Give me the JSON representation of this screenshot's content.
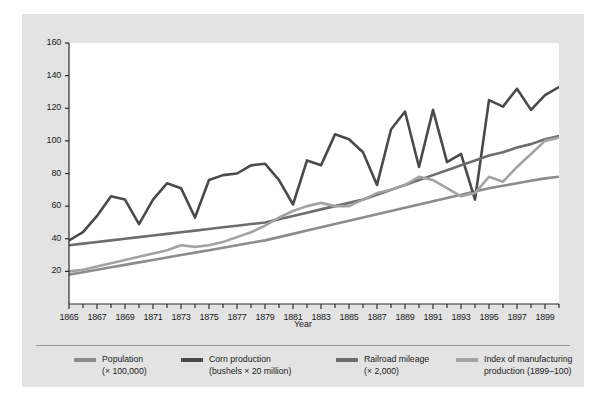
{
  "chart_data": {
    "type": "line",
    "title": "",
    "xlabel": "Year",
    "ylabel": "",
    "grid": false,
    "legend_position": "bottom",
    "xlim": [
      1865,
      1900
    ],
    "ylim": [
      0,
      160
    ],
    "yticks": [
      20,
      40,
      60,
      80,
      100,
      120,
      140,
      160
    ],
    "xticks": [
      1865,
      1866,
      1867,
      1868,
      1869,
      1870,
      1871,
      1872,
      1873,
      1874,
      1875,
      1876,
      1877,
      1878,
      1879,
      1880,
      1881,
      1882,
      1883,
      1884,
      1885,
      1886,
      1887,
      1888,
      1889,
      1890,
      1891,
      1892,
      1893,
      1894,
      1895,
      1896,
      1897,
      1898,
      1899,
      1900
    ],
    "xtick_labels": [
      "1865",
      "",
      "1867",
      "",
      "1869",
      "",
      "1871",
      "",
      "1873",
      "",
      "1875",
      "",
      "1877",
      "",
      "1879",
      "",
      "1881",
      "",
      "1883",
      "",
      "1885",
      "",
      "1887",
      "",
      "1889",
      "",
      "1891",
      "",
      "1893",
      "",
      "1895",
      "",
      "1897",
      "",
      "1899",
      ""
    ],
    "x": [
      1865,
      1866,
      1867,
      1868,
      1869,
      1870,
      1871,
      1872,
      1873,
      1874,
      1875,
      1876,
      1877,
      1878,
      1879,
      1880,
      1881,
      1882,
      1883,
      1884,
      1885,
      1886,
      1887,
      1888,
      1889,
      1890,
      1891,
      1892,
      1893,
      1894,
      1895,
      1896,
      1897,
      1898,
      1899,
      1900
    ],
    "series": [
      {
        "name": "Population",
        "label": "Population",
        "sublabel": "(× 100,000)",
        "color": "#8c8c8c",
        "values": [
          18,
          19.5,
          21,
          22.5,
          24,
          25.5,
          27,
          28.5,
          30,
          31.5,
          33,
          34.5,
          36,
          37.5,
          39,
          41,
          43,
          45,
          47,
          49,
          51,
          53,
          55,
          57,
          59,
          61,
          63,
          65,
          67,
          69,
          71,
          72.5,
          74,
          75.5,
          77,
          78
        ]
      },
      {
        "name": "Corn production",
        "label": "Corn production",
        "sublabel": "(bushels × 20 million)",
        "color": "#4a4a4a",
        "values": [
          39,
          44,
          54,
          66,
          64,
          49,
          64,
          74,
          71,
          53,
          76,
          79,
          80,
          85,
          86,
          76,
          61,
          88,
          85,
          104,
          101,
          93,
          73,
          107,
          118,
          84,
          119,
          87,
          92,
          64,
          125,
          121,
          132,
          119,
          128,
          133
        ]
      },
      {
        "name": "Railroad mileage",
        "label": "Railroad mileage",
        "sublabel": "(× 2,000)",
        "color": "#6d6d6d",
        "values": [
          36,
          37,
          38,
          39,
          40,
          41,
          42,
          43,
          44,
          45,
          46,
          47,
          48,
          49,
          50,
          52,
          54,
          56,
          58,
          60,
          62,
          64,
          67,
          70,
          73,
          76,
          79,
          82,
          85,
          88,
          91,
          93,
          96,
          98,
          101,
          103
        ]
      },
      {
        "name": "Index of manufacturing production",
        "label": "Index of manufacturing",
        "sublabel": "production (1899–100)",
        "color": "#a3a3a3",
        "values": [
          20,
          21,
          23,
          25,
          27,
          29,
          31,
          33,
          36,
          35,
          36,
          38,
          41,
          44,
          48,
          53,
          57,
          60,
          62,
          60,
          60,
          64,
          68,
          70,
          73,
          78,
          76,
          71,
          66,
          68,
          78,
          75,
          84,
          92,
          100,
          102
        ]
      }
    ]
  },
  "axis": {
    "x_title": "Year"
  },
  "legend": {
    "entries": [
      {
        "label": "Population",
        "sublabel": "(× 100,000)",
        "color": "#8c8c8c"
      },
      {
        "label": "Corn production",
        "sublabel": "(bushels × 20 million)",
        "color": "#4a4a4a"
      },
      {
        "label": "Railroad mileage",
        "sublabel": "(× 2,000)",
        "color": "#6d6d6d"
      },
      {
        "label": "Index of manufacturing",
        "sublabel": "production (1899–100)",
        "color": "#a3a3a3"
      }
    ]
  }
}
